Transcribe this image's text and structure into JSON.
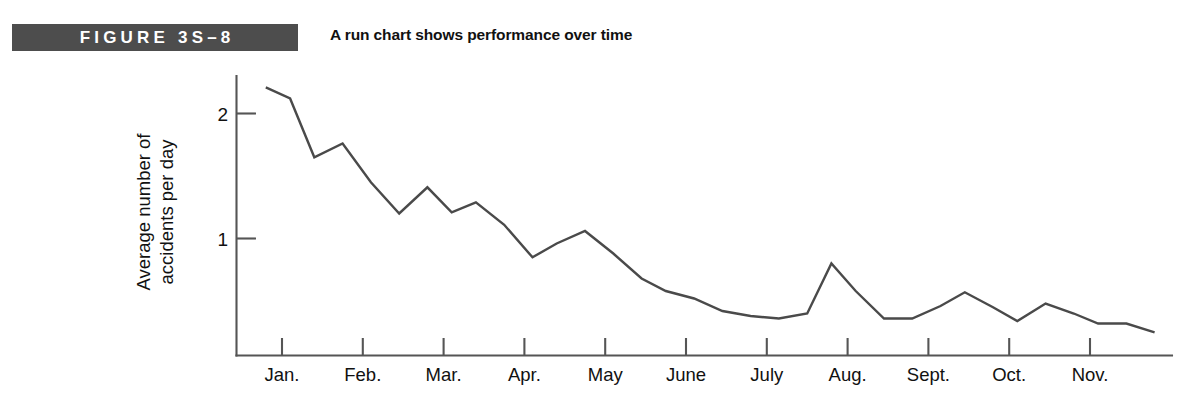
{
  "figure": {
    "label": "FIGURE 3S–8",
    "subtitle": "A run chart shows performance over time",
    "label_bar_color": "#4d4d4d",
    "label_text_color": "#ffffff",
    "line_color": "#4a4a4a",
    "axis_color": "#555555"
  },
  "chart_data": {
    "type": "line",
    "title": "A run chart shows performance over time",
    "xlabel": "",
    "ylabel": "Average number of accidents per day",
    "ylabel_lines": [
      "Average number of",
      "accidents per day"
    ],
    "ylim": [
      0,
      2.35
    ],
    "yticks": [
      1,
      2
    ],
    "ytick_labels": [
      "1",
      "2"
    ],
    "grid": false,
    "legend": "none",
    "categories": [
      "Jan.",
      "Feb.",
      "Mar.",
      "Apr.",
      "May",
      "June",
      "July",
      "Aug.",
      "Sept.",
      "Oct.",
      "Nov."
    ],
    "x_note": "Data sampled about three times per month; month labels mark tick positions along the time axis.",
    "series": [
      {
        "name": "Average number of accidents per day",
        "x": [
          0.8,
          1.1,
          1.4,
          1.75,
          2.1,
          2.45,
          2.8,
          3.1,
          3.4,
          3.75,
          4.1,
          4.4,
          4.75,
          5.1,
          5.45,
          5.75,
          6.1,
          6.45,
          6.8,
          7.15,
          7.5,
          7.8,
          8.1,
          8.45,
          8.8,
          9.15,
          9.45,
          9.8,
          10.1,
          10.45,
          10.8,
          11.1,
          11.45,
          11.8
        ],
        "values": [
          2.21,
          2.12,
          1.65,
          1.76,
          1.45,
          1.2,
          1.41,
          1.21,
          1.29,
          1.11,
          0.85,
          0.96,
          1.06,
          0.88,
          0.68,
          0.58,
          0.52,
          0.42,
          0.38,
          0.36,
          0.4,
          0.8,
          0.58,
          0.36,
          0.36,
          0.46,
          0.57,
          0.45,
          0.34,
          0.48,
          0.4,
          0.32,
          0.32,
          0.25
        ]
      }
    ]
  },
  "axis": {
    "y_label_line1": "Average number of",
    "y_label_line2": "accidents per day",
    "y_tick_2": "2",
    "y_tick_1": "1"
  }
}
